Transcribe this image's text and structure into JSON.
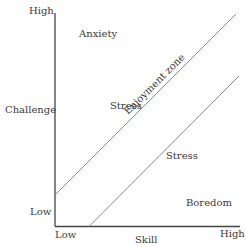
{
  "diagram": {
    "type": "flow-channel",
    "y_axis": {
      "label": "Challenge",
      "high": "High",
      "low": "Low"
    },
    "x_axis": {
      "label": "Skill",
      "high": "High",
      "low": "Low"
    },
    "regions": {
      "anxiety": "Anxiety",
      "stress_upper": "Stress",
      "enjoyment_zone": "Enjoyment zone",
      "stress_lower": "Stress",
      "boredom": "Boredom"
    },
    "colors": {
      "axis": "#444444",
      "diagonal": "#8a8a8a",
      "text": "#3a3a3a"
    }
  }
}
